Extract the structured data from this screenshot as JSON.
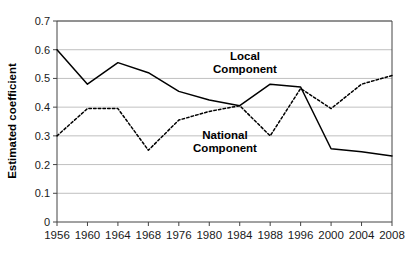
{
  "chart_data": {
    "type": "line",
    "title": "",
    "subtitle": "",
    "xlabel": "",
    "ylabel": "Estimated coefficient",
    "categories": [
      "1956",
      "1960",
      "1964",
      "1968",
      "1976",
      "1980",
      "1984",
      "1988",
      "1996",
      "2000",
      "2004",
      "2008"
    ],
    "series": [
      {
        "name": "Local Component",
        "style": "solid",
        "color": "#000000",
        "values": [
          0.6,
          0.48,
          0.555,
          0.52,
          0.455,
          0.425,
          0.405,
          0.48,
          0.47,
          0.255,
          0.245,
          0.23
        ]
      },
      {
        "name": "National Component",
        "style": "dashed",
        "color": "#000000",
        "values": [
          0.3,
          0.395,
          0.395,
          0.25,
          0.355,
          0.385,
          0.405,
          0.3,
          0.465,
          0.395,
          0.48,
          0.51
        ]
      }
    ],
    "ylim": [
      0,
      0.7
    ],
    "yticks": [
      "0",
      "0.1",
      "0.2",
      "0.3",
      "0.4",
      "0.5",
      "0.6",
      "0.7"
    ],
    "ytick_values": [
      0,
      0.1,
      0.2,
      0.3,
      0.4,
      0.5,
      0.6,
      0.7
    ],
    "grid": "horizontal",
    "grid_color": "#b0b0b0",
    "legend": "none",
    "annotations": [
      {
        "id": "local-component",
        "line1": "Local",
        "line2": "Component",
        "x": 245,
        "y": 60
      },
      {
        "id": "national-component",
        "line1": "National",
        "line2": "Component",
        "x": 225,
        "y": 139
      }
    ],
    "plot_area": {
      "left": 57,
      "right": 392,
      "top": 21,
      "bottom": 222
    },
    "background": "#ffffff"
  }
}
